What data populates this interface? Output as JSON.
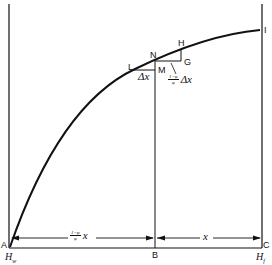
{
  "diagram": {
    "points": {
      "A": "A",
      "B": "B",
      "C": "C",
      "I": "I",
      "N": "N",
      "H": "H",
      "G": "G",
      "L": "L",
      "M": "M"
    },
    "axis_labels": {
      "left": "H",
      "left_sub": "w",
      "right": "H",
      "right_sub": "f"
    },
    "annotations": {
      "delta_x": "Δx",
      "slope_fraction_num": "1−φ",
      "slope_fraction_den": "φ",
      "slope_var": "Δx",
      "left_span_num": "1−φ",
      "left_span_den": "φ",
      "left_span_var": "x",
      "right_span": "x"
    },
    "colors": {
      "ink": "#111111",
      "background": "#ffffff"
    }
  }
}
